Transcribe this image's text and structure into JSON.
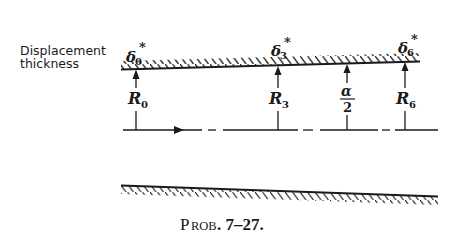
{
  "diagram": {
    "label": {
      "line1": "Displacement",
      "line2": "thickness"
    },
    "symbols": {
      "delta": "δ",
      "star": "*",
      "R": "R",
      "alpha": "α",
      "two": "2"
    },
    "stations": [
      {
        "id": "0",
        "delta_sub": "0",
        "r_sub": "0"
      },
      {
        "id": "3",
        "delta_sub": "3",
        "r_sub": "3"
      },
      {
        "id": "half-angle",
        "numerator": "α",
        "denominator": "2"
      },
      {
        "id": "6",
        "delta_sub": "6",
        "r_sub": "6"
      }
    ],
    "caption": {
      "prefix_big": "P",
      "prefix_small": "ROB",
      "number": ". 7–27."
    },
    "colors": {
      "ink": "#1a1a1a",
      "background": "#ffffff"
    }
  }
}
